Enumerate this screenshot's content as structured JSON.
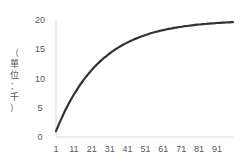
{
  "chart_data": {
    "type": "line",
    "title": "",
    "xlabel": "",
    "ylabel": "（單位：千）",
    "x_tick_labels": [
      "1",
      "11",
      "21",
      "31",
      "41",
      "51",
      "61",
      "71",
      "81",
      "91"
    ],
    "y_tick_labels": [
      "0",
      "5",
      "10",
      "15",
      "20"
    ],
    "ylim": [
      0,
      20
    ],
    "xlim": [
      1,
      100
    ],
    "grid": false,
    "legend": null,
    "series": [
      {
        "name": "series1",
        "color": "#333333",
        "x": [
          1,
          6,
          11,
          16,
          21,
          26,
          31,
          36,
          41,
          46,
          51,
          56,
          61,
          66,
          71,
          76,
          81,
          86,
          91,
          96,
          100
        ],
        "values": [
          1.0,
          4.4,
          7.0,
          9.3,
          11.4,
          13.0,
          14.3,
          15.5,
          16.4,
          17.1,
          17.7,
          18.2,
          18.6,
          18.9,
          19.2,
          19.4,
          19.6,
          19.7,
          19.8,
          19.9,
          19.9
        ]
      }
    ]
  }
}
